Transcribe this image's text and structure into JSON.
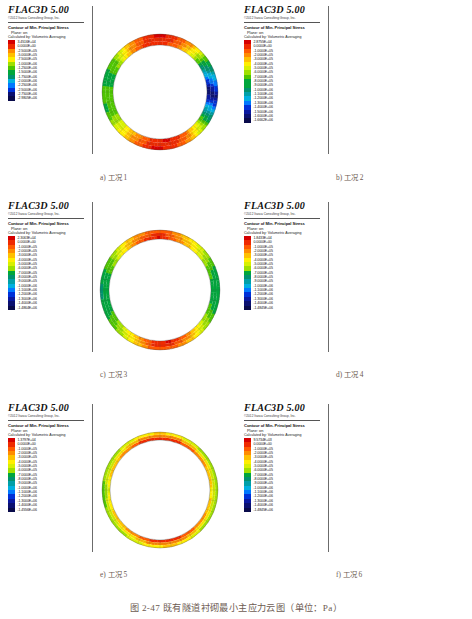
{
  "figure": {
    "caption": "图 2-47  既有隧道衬砌最小主应力云图（单位：Pa）"
  },
  "common": {
    "app_title": "FLAC3D 5.00",
    "copyright": "©2012 Itasca Consulting Group, Inc.",
    "contour_title": "Contour of Min. Principal Stress",
    "plane_line": "Plane: on",
    "calc_line": "Calculated by: Volumetric Averaging",
    "colors": [
      "#d50000",
      "#ef2a00",
      "#ff5a00",
      "#ff8c00",
      "#ffc000",
      "#ffee00",
      "#d8f000",
      "#9fe000",
      "#4fc600",
      "#00a63c",
      "#00926e",
      "#00a0a8",
      "#00b0e0",
      "#0078ff",
      "#0030d8",
      "#0a18a0",
      "#0b1070",
      "#090a4a"
    ]
  },
  "chart_data": [
    {
      "type": "contour",
      "id": "case-1",
      "label": "a) 工况 1",
      "title": "Contour of Min. Principal Stress",
      "units": "Pa",
      "legend_values": [
        "3.4516E+04",
        "0.0000E+00",
        "-2.5000E+05",
        "-5.0000E+05",
        "-7.5000E+05",
        "-1.0000E+06",
        "-1.2500E+06",
        "-1.5000E+06",
        "-1.7500E+06",
        "-2.0000E+06",
        "-2.2500E+06",
        "-2.5000E+06",
        "-2.7500E+06",
        "-2.9805E+06"
      ],
      "max": 34516,
      "min": -2980500,
      "ring_description": "red at crown and invert, green at left haunch, dark blue at right springline"
    },
    {
      "type": "contour",
      "id": "case-2",
      "label": "b) 工况 2",
      "title": "Contour of Min. Principal Stress",
      "units": "Pa",
      "legend_values": [
        "2.8755E+04",
        "0.0000E+00",
        "-1.0000E+05",
        "-2.0000E+05",
        "-3.0000E+05",
        "-4.0000E+05",
        "-5.0000E+05",
        "-6.0000E+05",
        "-7.0000E+05",
        "-8.0000E+05",
        "-9.0000E+05",
        "-1.0000E+06",
        "-1.1000E+06",
        "-1.2000E+06",
        "-1.3000E+06",
        "-1.4000E+06",
        "-1.5000E+06",
        "-1.6000E+06",
        "-1.6662E+06"
      ],
      "max": 28755,
      "min": -1666200,
      "ring_description": "red at crown and invert, green ring, blue patch at right springline"
    },
    {
      "type": "contour",
      "id": "case-3",
      "label": "c) 工况 3",
      "title": "Contour of Min. Principal Stress",
      "units": "Pa",
      "legend_values": [
        "2.3063E+04",
        "0.0000E+00",
        "-1.0000E+05",
        "-2.0000E+05",
        "-3.0000E+05",
        "-4.0000E+05",
        "-5.0000E+05",
        "-6.0000E+05",
        "-7.0000E+05",
        "-8.0000E+05",
        "-9.0000E+05",
        "-1.0000E+06",
        "-1.1000E+06",
        "-1.2000E+06",
        "-1.3000E+06",
        "-1.4000E+06",
        "-1.4864E+06"
      ],
      "max": 23063,
      "min": -1486400,
      "ring_description": "red inner band at crown and invert, green at sides"
    },
    {
      "type": "contour",
      "id": "case-4",
      "label": "d) 工况 4",
      "title": "Contour of Min. Principal Stress",
      "units": "Pa",
      "legend_values": [
        "1.8433E+04",
        "0.0000E+00",
        "-1.0000E+05",
        "-2.0000E+05",
        "-3.0000E+05",
        "-4.0000E+05",
        "-5.0000E+05",
        "-6.0000E+05",
        "-7.0000E+05",
        "-8.0000E+05",
        "-9.0000E+05",
        "-1.0000E+06",
        "-1.1000E+06",
        "-1.2000E+06",
        "-1.3000E+06",
        "-1.4000E+06",
        "-1.4845E+06"
      ],
      "max": 18433,
      "min": -1484500,
      "ring_description": "red inner band around most of ring, green outer edge at sides"
    },
    {
      "type": "contour",
      "id": "case-5",
      "label": "e) 工况 5",
      "title": "Contour of Min. Principal Stress",
      "units": "Pa",
      "legend_values": [
        "1.3797E+04",
        "0.0000E+00",
        "-1.0000E+05",
        "-2.0000E+05",
        "-3.0000E+05",
        "-4.0000E+05",
        "-5.0000E+05",
        "-6.0000E+05",
        "-7.0000E+05",
        "-8.0000E+05",
        "-9.0000E+05",
        "-1.0000E+06",
        "-1.1000E+06",
        "-1.2000E+06",
        "-1.3000E+06",
        "-1.4000E+06",
        "-1.4556E+06"
      ],
      "max": 13797,
      "min": -1455600,
      "ring_description": "mostly red and orange ring with thin green outer rim"
    },
    {
      "type": "contour",
      "id": "case-6",
      "label": "f) 工况 6",
      "title": "Contour of Min. Principal Stress",
      "units": "Pa",
      "legend_values": [
        "9.5734E+03",
        "0.0000E+00",
        "-1.0000E+05",
        "-2.0000E+05",
        "-3.0000E+05",
        "-4.0000E+05",
        "-5.0000E+05",
        "-6.0000E+05",
        "-7.0000E+05",
        "-8.0000E+05",
        "-9.0000E+05",
        "-1.0000E+06",
        "-1.1000E+06",
        "-1.2000E+06",
        "-1.3000E+06",
        "-1.4000E+06",
        "-1.4845E+06"
      ],
      "max": 9573.4,
      "min": -1484500,
      "ring_description": "uniform red ring with thin yellow-green outer rim"
    }
  ]
}
